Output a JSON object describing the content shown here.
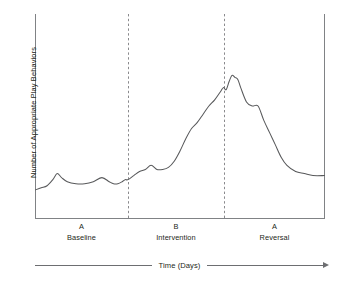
{
  "chart_data": {
    "type": "line",
    "title": "",
    "xlabel": "Time (Days)",
    "ylabel": "Number of Appropriate Play Behaviors",
    "grid": false,
    "legend": false,
    "axis_ticks": false,
    "xlim": [
      0,
      100
    ],
    "ylim": [
      0,
      100
    ],
    "line_color": "#58595b",
    "divider_color": "#8a8a8d",
    "frame_color": "#808285",
    "phase_dividers_x": [
      32,
      65
    ],
    "annotations": [
      {
        "letter": "A",
        "name": "Baseline",
        "x_center": 16
      },
      {
        "letter": "B",
        "name": "Intervention",
        "x_center": 48.5
      },
      {
        "letter": "A",
        "name": "Reversal",
        "x_center": 82.5
      }
    ],
    "series": [
      {
        "name": "Appropriate play behaviors",
        "x": [
          0,
          2,
          4,
          6,
          7.5,
          9,
          11,
          14,
          17,
          20,
          23,
          25.5,
          27,
          28.5,
          30,
          31,
          32,
          34,
          36,
          38,
          40,
          42,
          44,
          46,
          48,
          50,
          52,
          54,
          56,
          58,
          60,
          62,
          64,
          65,
          66,
          67,
          68,
          69,
          70,
          71,
          73,
          75,
          77,
          79,
          81,
          83,
          85,
          87,
          90,
          93,
          96,
          100
        ],
        "y": [
          14,
          15,
          16,
          19,
          22,
          20,
          18,
          17,
          17,
          18,
          20,
          18,
          17,
          17,
          18,
          19,
          19,
          21,
          23,
          24,
          26,
          24,
          24,
          25,
          28,
          33,
          39,
          44,
          47,
          51,
          55,
          58,
          62,
          64,
          63,
          67,
          70,
          69,
          68,
          64,
          57,
          55,
          55,
          48,
          42,
          36,
          30,
          26,
          23,
          22,
          21,
          21
        ]
      }
    ]
  },
  "axes": {
    "y_axis_label": "Number of Appropriate Play Behaviors",
    "x_axis_label": "Time (Days)"
  },
  "phases": [
    {
      "letter": "A",
      "name": "Baseline"
    },
    {
      "letter": "B",
      "name": "Intervention"
    },
    {
      "letter": "A",
      "name": "Reversal"
    }
  ]
}
